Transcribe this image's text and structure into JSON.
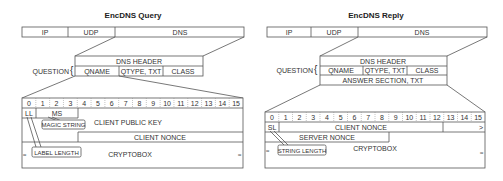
{
  "query": {
    "title": "EncDNS Query",
    "top_bar": [
      "IP",
      "UDP",
      "DNS"
    ],
    "question_label": "QUESTION",
    "dns_header": "DNS HEADER",
    "question_fields": [
      "QNAME",
      "QTYPE, TXT",
      "CLASS"
    ],
    "byte_indices": [
      "0",
      "1",
      "2",
      "3",
      "4",
      "5",
      "6",
      "7",
      "8",
      "9",
      "10",
      "11",
      "12",
      "13",
      "14",
      "15"
    ],
    "fields": {
      "ll": "LL",
      "ms": "MS",
      "magic_string": "MAGIC STRING",
      "client_public_key": "CLIENT PUBLIC KEY",
      "client_nonce": "CLIENT NONCE",
      "label_length": "LABEL LENGTH",
      "cryptobox": "CRYPTOBOX"
    }
  },
  "reply": {
    "title": "EncDNS Reply",
    "top_bar": [
      "IP",
      "UDP",
      "DNS"
    ],
    "question_label": "QUESTION",
    "dns_header": "DNS HEADER",
    "question_fields": [
      "QNAME",
      "QTYPE, TXT",
      "CLASS"
    ],
    "answer_section": "ANSWER SECTION, TXT",
    "byte_indices": [
      "0",
      "1",
      "2",
      "3",
      "4",
      "5",
      "6",
      "7",
      "8",
      "9",
      "10",
      "11",
      "12",
      "13",
      "14",
      "15"
    ],
    "fields": {
      "sl": "SL",
      "client_nonce": "CLIENT NONCE",
      "continuation": ">",
      "server_nonce": "SERVER NONCE",
      "string_length": "STRING LENGTH",
      "cryptobox": "CRYPTOBOX"
    }
  }
}
